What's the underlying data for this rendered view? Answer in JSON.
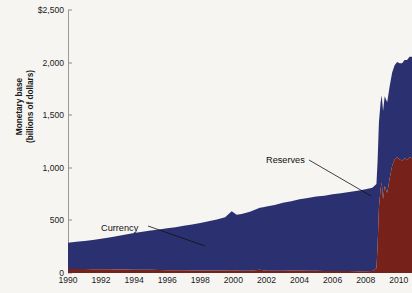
{
  "chart_data": {
    "type": "area",
    "title": "",
    "xlabel": "",
    "ylabel": "Monetary base (billions of dollars)",
    "ylabel_line1": "Monetary base",
    "ylabel_line2": "(billions of dollars)",
    "stacked": true,
    "grid": false,
    "legend_position": "inline-annotations",
    "xlim": [
      1990,
      2010.8
    ],
    "ylim": [
      0,
      2500
    ],
    "y_ticks": [
      0,
      500,
      1000,
      1500,
      2000,
      2500
    ],
    "y_ticklabels": [
      "0",
      "500",
      "1,000",
      "1,500",
      "2,000",
      "$2,500"
    ],
    "x_ticks": [
      1990,
      1992,
      1994,
      1996,
      1998,
      2000,
      2002,
      2004,
      2006,
      2008,
      2010
    ],
    "x_ticklabels": [
      "1990",
      "1992",
      "1994",
      "1996",
      "1998",
      "2000",
      "2002",
      "2004",
      "2006",
      "2008",
      "2010"
    ],
    "annotations": [
      {
        "text": "Currency",
        "x": 1993.9,
        "y": 680
      },
      {
        "text": "Reserves",
        "x": 2002.8,
        "y": 1095
      }
    ],
    "colors": {
      "currency": "#2b3070",
      "reserves": "#76221a",
      "axis": "#9a9a9a",
      "text": "#1b1b1b",
      "background": "#f6f5f2",
      "plot_background": "#ffffff"
    },
    "series": [
      {
        "name": "Reserves",
        "color": "#76221a",
        "x": [
          1990.0,
          1990.5,
          1991.0,
          1991.5,
          1992.0,
          1992.5,
          1993.0,
          1993.5,
          1994.0,
          1994.5,
          1995.0,
          1995.5,
          1996.0,
          1996.5,
          1997.0,
          1997.5,
          1998.0,
          1998.5,
          1999.0,
          1999.5,
          1999.9,
          2000.2,
          2000.5,
          2001.0,
          2001.6,
          2001.8,
          2002.0,
          2002.5,
          2003.0,
          2003.5,
          2004.0,
          2004.5,
          2005.0,
          2005.5,
          2006.0,
          2006.5,
          2007.0,
          2007.5,
          2008.0,
          2008.4,
          2008.65,
          2008.72,
          2008.8,
          2008.9,
          2008.97,
          2009.05,
          2009.15,
          2009.3,
          2009.45,
          2009.6,
          2009.75,
          2009.9,
          2010.05,
          2010.2,
          2010.35,
          2010.5,
          2010.65,
          2010.8
        ],
        "y": [
          38,
          38,
          37,
          36,
          36,
          35,
          34,
          33,
          32,
          31,
          30,
          28,
          27,
          26,
          25,
          24,
          24,
          23,
          23,
          24,
          26,
          24,
          22,
          22,
          30,
          25,
          22,
          21,
          22,
          23,
          23,
          22,
          21,
          20,
          20,
          19,
          18,
          17,
          17,
          20,
          45,
          260,
          620,
          800,
          860,
          700,
          830,
          760,
          900,
          1020,
          1080,
          1100,
          1080,
          1070,
          1090,
          1080,
          1100,
          1090
        ]
      },
      {
        "name": "Currency",
        "color": "#2b3070",
        "x": [
          1990.0,
          1990.5,
          1991.0,
          1991.5,
          1992.0,
          1992.5,
          1993.0,
          1993.5,
          1994.0,
          1994.5,
          1995.0,
          1995.5,
          1996.0,
          1996.5,
          1997.0,
          1997.5,
          1998.0,
          1998.5,
          1999.0,
          1999.5,
          1999.9,
          2000.2,
          2000.5,
          2001.0,
          2001.6,
          2001.8,
          2002.0,
          2002.5,
          2003.0,
          2003.5,
          2004.0,
          2004.5,
          2005.0,
          2005.5,
          2006.0,
          2006.5,
          2007.0,
          2007.5,
          2008.0,
          2008.4,
          2008.65,
          2008.72,
          2008.8,
          2008.9,
          2008.97,
          2009.05,
          2009.15,
          2009.3,
          2009.45,
          2009.6,
          2009.75,
          2009.9,
          2010.05,
          2010.2,
          2010.35,
          2010.5,
          2010.65,
          2010.8
        ],
        "y": [
          250,
          258,
          268,
          278,
          290,
          302,
          318,
          332,
          348,
          362,
          375,
          385,
          398,
          410,
          425,
          438,
          452,
          468,
          485,
          505,
          560,
          530,
          540,
          560,
          590,
          600,
          610,
          625,
          645,
          660,
          678,
          692,
          705,
          715,
          728,
          740,
          752,
          765,
          778,
          790,
          800,
          805,
          810,
          820,
          830,
          840,
          850,
          862,
          875,
          885,
          895,
          905,
          915,
          925,
          935,
          945,
          955,
          965
        ]
      }
    ],
    "total_peak": 2150
  }
}
